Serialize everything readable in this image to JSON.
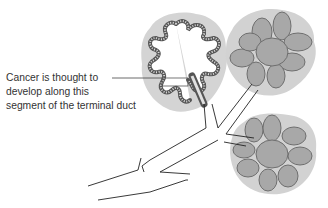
{
  "diagram": {
    "annotation": {
      "line1": "Cancer is thought to",
      "line2": "develop along this",
      "line3": "segment of the terminal duct"
    },
    "colors": {
      "halo": "#d2d2d2",
      "lobule_fill": "#a9a9a9",
      "lobule_outline": "#6e6e6e",
      "duct_line": "#222222",
      "text": "#333333"
    }
  }
}
